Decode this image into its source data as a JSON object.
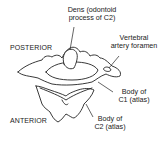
{
  "diagram": {
    "type": "anatomical illustration",
    "orientation_labels": {
      "top": "POSTERIOR",
      "bottom": "ANTERIOR"
    },
    "labels": [
      {
        "id": "dens",
        "line1": "Dens (odontoid",
        "line2": "process of C2)"
      },
      {
        "id": "vertebral-artery-foramen",
        "line1": "Vertebral",
        "line2": "artery foramen"
      },
      {
        "id": "body-c1",
        "line1": "Body of",
        "line2": "C1 (atlas)"
      },
      {
        "id": "body-c2",
        "line1": "Body of",
        "line2": "C2 (atlas)"
      }
    ],
    "colors": {
      "line": "#222222",
      "fill": "#ffffff",
      "background": "#ffffff"
    }
  }
}
